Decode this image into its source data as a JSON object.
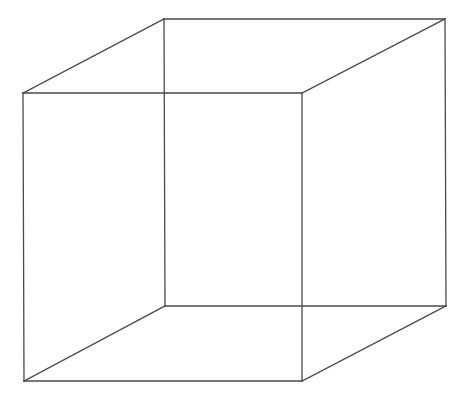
{
  "figure": {
    "type": "line-drawing",
    "background_color": "#ffffff",
    "stroke_color": "#4a4a4a",
    "stroke_width_px": 1.3,
    "canvas": {
      "width": 465,
      "height": 397
    },
    "projection": "oblique / parallel (cabinet-like)",
    "depth_offset": {
      "dx": 141,
      "dy": -74
    },
    "vertices": {
      "front_top_left": {
        "label": "A",
        "x": 23,
        "y": 93
      },
      "front_top_right": {
        "label": "B",
        "x": 302,
        "y": 93
      },
      "front_bottom_right": {
        "label": "C",
        "x": 302,
        "y": 381
      },
      "front_bottom_left": {
        "label": "D",
        "x": 24,
        "y": 381
      },
      "back_top_left": {
        "label": "E",
        "x": 164,
        "y": 19
      },
      "back_top_right": {
        "label": "F",
        "x": 445,
        "y": 19
      },
      "back_bottom_right": {
        "label": "G",
        "x": 446,
        "y": 306
      },
      "back_bottom_left": {
        "label": "H",
        "x": 165,
        "y": 306
      }
    },
    "edges": [
      {
        "name": "front-top-edge",
        "from": "front_top_left",
        "to": "front_top_right"
      },
      {
        "name": "front-right-edge",
        "from": "front_top_right",
        "to": "front_bottom_right"
      },
      {
        "name": "front-bottom-edge",
        "from": "front_bottom_right",
        "to": "front_bottom_left"
      },
      {
        "name": "front-left-edge",
        "from": "front_bottom_left",
        "to": "front_top_left"
      },
      {
        "name": "back-top-edge",
        "from": "back_top_left",
        "to": "back_top_right"
      },
      {
        "name": "back-right-edge",
        "from": "back_top_right",
        "to": "back_bottom_right"
      },
      {
        "name": "back-bottom-edge",
        "from": "back_bottom_right",
        "to": "back_bottom_left"
      },
      {
        "name": "back-left-edge",
        "from": "back_bottom_left",
        "to": "back_top_left"
      },
      {
        "name": "connector-top-left",
        "from": "front_top_left",
        "to": "back_top_left"
      },
      {
        "name": "connector-top-right",
        "from": "front_top_right",
        "to": "back_top_right"
      },
      {
        "name": "connector-bottom-right",
        "from": "front_bottom_right",
        "to": "back_bottom_right"
      },
      {
        "name": "connector-bottom-left",
        "from": "front_bottom_left",
        "to": "back_bottom_left"
      }
    ]
  }
}
